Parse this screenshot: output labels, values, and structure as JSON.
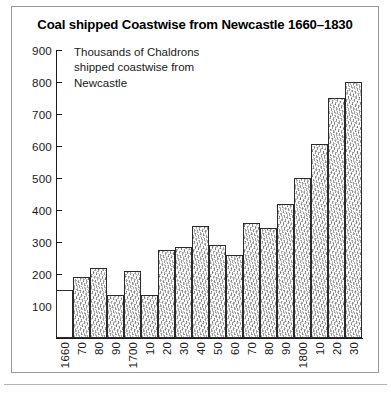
{
  "figure": {
    "title": "Coal shipped Coastwise from Newcastle 1660–1830",
    "annotation_lines": [
      "Thousands of Chaldrons",
      "shipped coastwise from",
      "Newcastle"
    ],
    "frame_color": "#9a9a9a",
    "axis_color": "#1a1a1a",
    "bar_border_color": "#2b2b2b",
    "bar_fill_color": "#fbfbfb"
  },
  "chart_data": {
    "type": "bar",
    "title": "Coal shipped Coastwise from Newcastle 1660–1830",
    "subtitle": "Thousands of Chaldrons shipped coastwise from Newcastle",
    "xlabel": "",
    "ylabel": "Thousands of Chaldrons",
    "ylim": [
      0,
      900
    ],
    "ytick_labels": [
      "900",
      "800",
      "700",
      "600",
      "500",
      "400",
      "300",
      "200",
      "100"
    ],
    "ytick_values": [
      900,
      800,
      700,
      600,
      500,
      400,
      300,
      200,
      100
    ],
    "ytick_step": 100,
    "grid": false,
    "legend": "none",
    "categories": [
      "1660",
      "70",
      "80",
      "90",
      "1700",
      "10",
      "20",
      "30",
      "40",
      "50",
      "60",
      "70",
      "80",
      "90",
      "1800",
      "10",
      "20",
      "30"
    ],
    "values": [
      150,
      190,
      220,
      135,
      210,
      135,
      275,
      285,
      350,
      290,
      260,
      360,
      345,
      420,
      500,
      605,
      750,
      800
    ],
    "bar_styles": [
      "plain",
      "textured",
      "textured",
      "textured",
      "textured",
      "textured",
      "textured",
      "textured",
      "textured",
      "textured",
      "textured",
      "textured",
      "textured",
      "textured",
      "textured",
      "textured",
      "textured",
      "textured"
    ]
  }
}
